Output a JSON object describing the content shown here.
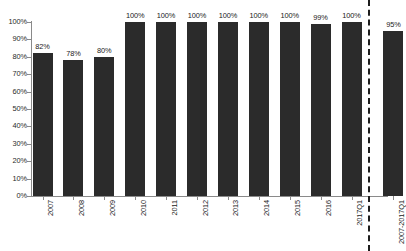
{
  "chart_data": {
    "type": "bar",
    "title": "",
    "subtitle": "",
    "xlabel": "",
    "ylabel": "",
    "ylim": [
      0,
      100
    ],
    "grid": false,
    "legend": null,
    "value_suffix": "%",
    "categories": [
      "2007",
      "2008",
      "2009",
      "2010",
      "2011",
      "2012",
      "2013",
      "2014",
      "2015",
      "2016",
      "2017Q1",
      "2007-2017Q1"
    ],
    "values": [
      82,
      78,
      80,
      100,
      100,
      100,
      100,
      100,
      100,
      99,
      100,
      95
    ],
    "data_labels": [
      "82%",
      "78%",
      "80%",
      "100%",
      "100%",
      "100%",
      "100%",
      "100%",
      "100%",
      "99%",
      "100%",
      "95%"
    ],
    "y_ticks": [
      0,
      10,
      20,
      30,
      40,
      50,
      60,
      70,
      80,
      90,
      100
    ],
    "y_tick_labels": [
      "0%",
      "10%",
      "20%",
      "30%",
      "40%",
      "50%",
      "60%",
      "70%",
      "80%",
      "90%",
      "100%"
    ],
    "series": [
      {
        "name": "",
        "values": [
          82,
          78,
          80,
          100,
          100,
          100,
          100,
          100,
          100,
          99,
          100,
          95
        ]
      }
    ],
    "annotations": [
      {
        "name": "total-separator",
        "type": "vertical-dashed-line",
        "after_category": "2017Q1",
        "color": "#1d1d1d"
      }
    ],
    "colors": {
      "bar": "#2b2b2b",
      "axis": "#8a8a8a",
      "text": "#222222",
      "background": "#ffffff",
      "separator": "#1d1d1d"
    }
  }
}
